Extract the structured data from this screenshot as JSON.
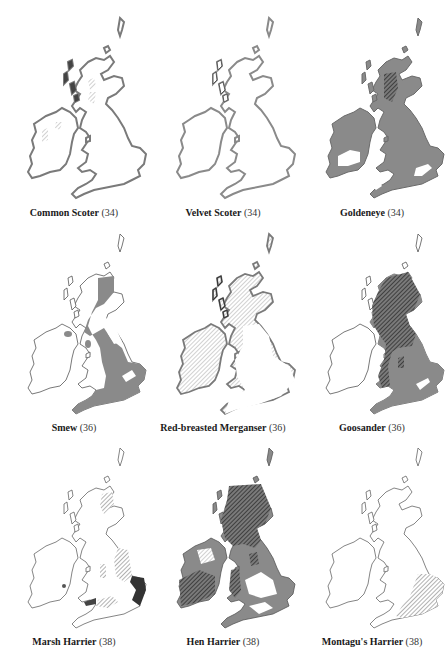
{
  "page": {
    "layout": "3x3 grid of distribution maps of Britain and Ireland",
    "colors": {
      "land_outline": "#555555",
      "land_fill": "#ffffff",
      "range_fill_grey": "#8a8a8a",
      "hatch_dark": "#2a2a2a",
      "hatch_light": "#9a9a9a"
    }
  },
  "maps": [
    {
      "name": "Common Scoter",
      "page": "(34)",
      "style": "outline-thick",
      "features": [
        "light hatching in western Scotland and western Ireland",
        "thick grey coastline"
      ]
    },
    {
      "name": "Velvet Scoter",
      "page": "(34)",
      "style": "outline-thick",
      "features": [
        "thick grey coastline around Britain",
        "sparse light hatching"
      ]
    },
    {
      "name": "Goldeneye",
      "page": "(34)",
      "style": "grey-fill",
      "features": [
        "grey fill over most of Britain and Ireland",
        "dark hatching in northern Scotland",
        "white gaps in central Ireland, south-east England and south-west"
      ]
    },
    {
      "name": "Smew",
      "page": "(36)",
      "style": "grey-partial",
      "features": [
        "grey fill in eastern and southern England",
        "white gap in East Anglia",
        "small grey patches in Ireland"
      ]
    },
    {
      "name": "Red-breasted Merganser",
      "page": "(36)",
      "style": "hatched-light",
      "features": [
        "light hatching over Scotland, northern England and Ireland",
        "thick grey coastline"
      ]
    },
    {
      "name": "Goosander",
      "page": "(36)",
      "style": "grey-hatched",
      "features": [
        "dark hatching over Scotland, northern England and Wales",
        "grey fill in central and southern England",
        "Ireland unshaded"
      ]
    },
    {
      "name": "Marsh Harrier",
      "page": "(38)",
      "style": "sparse",
      "features": [
        "hatched patches in eastern Scotland, Lincolnshire and southern England",
        "dark fill in East Anglia"
      ]
    },
    {
      "name": "Hen Harrier",
      "page": "(38)",
      "style": "grey-hatched",
      "features": [
        "dark hatching over Scotland, Wales and southern Ireland",
        "grey fill across England and northern Ireland",
        "white gaps in the Midlands and south"
      ]
    },
    {
      "name": "Montagu's Harrier",
      "page": "(38)",
      "style": "sparse",
      "features": [
        "hatching in southern and eastern England only"
      ]
    }
  ]
}
